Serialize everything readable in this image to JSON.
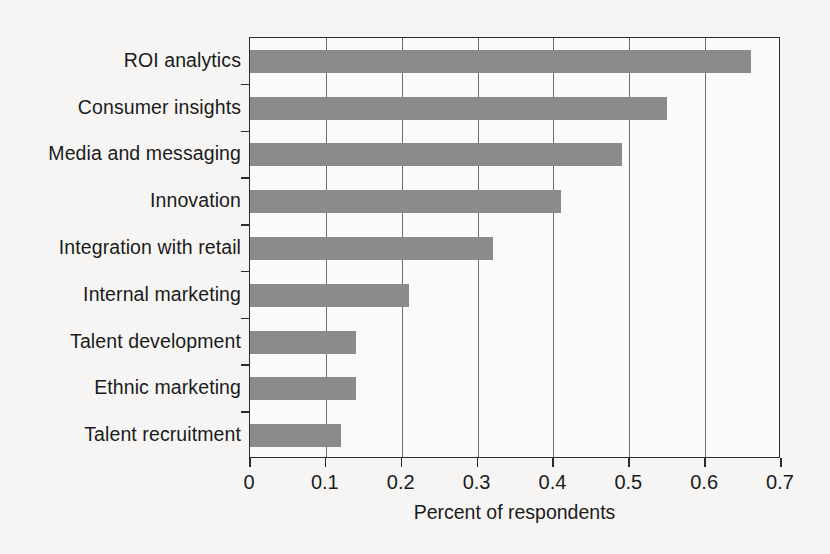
{
  "chart_data": {
    "type": "bar",
    "orientation": "horizontal",
    "title": "",
    "xlabel": "Percent of respondents",
    "ylabel": "",
    "xlim": [
      0,
      0.7
    ],
    "xticks": [
      "0",
      "0.1",
      "0.2",
      "0.3",
      "0.4",
      "0.5",
      "0.6",
      "0.7"
    ],
    "xtick_values": [
      0,
      0.1,
      0.2,
      0.3,
      0.4,
      0.5,
      0.6,
      0.7
    ],
    "grid": "vertical",
    "legend": "none",
    "bar_color": "#8b8b8b",
    "categories": [
      "ROI analytics",
      "Consumer insights",
      "Media and messaging",
      "Innovation",
      "Integration with retail",
      "Internal marketing",
      "Talent development",
      "Ethnic marketing",
      "Talent recruitment"
    ],
    "values": [
      0.66,
      0.55,
      0.49,
      0.41,
      0.32,
      0.21,
      0.14,
      0.14,
      0.12
    ]
  }
}
